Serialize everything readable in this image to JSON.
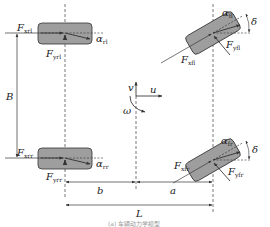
{
  "diagram": {
    "type": "vehicle-dynamics-four-wheel-model",
    "colors": {
      "wheel_fill": "#9e9e9e",
      "wheel_stroke": "#333333",
      "line": "#333333",
      "background": "#ffffff"
    },
    "coordinate_system": {
      "v_label": "v",
      "u_label": "u",
      "omega_label": "ω"
    },
    "dimensions": {
      "track_width_label": "B",
      "rear_to_cg_label": "b",
      "front_to_cg_label": "a",
      "wheelbase_label": "L"
    },
    "wheels": {
      "rear_left": {
        "fx_main": "F",
        "fx_sub": "xrl",
        "fy_main": "F",
        "fy_sub": "yrl",
        "alpha_main": "α",
        "alpha_sub": "rl"
      },
      "rear_right": {
        "fx_main": "F",
        "fx_sub": "xrr",
        "fy_main": "F",
        "fy_sub": "yrr",
        "alpha_main": "α",
        "alpha_sub": "rr"
      },
      "front_left": {
        "fx_main": "F",
        "fx_sub": "xfl",
        "fy_main": "F",
        "fy_sub": "yfl",
        "alpha_main": "α",
        "alpha_sub": "fl",
        "steer_label": "δ"
      },
      "front_right": {
        "fx_main": "F",
        "fx_sub": "xfr",
        "fy_main": "F",
        "fy_sub": "yfr",
        "alpha_main": "α",
        "alpha_sub": "fr",
        "steer_label": "δ"
      }
    },
    "caption": "(a) 车辆动力学模型"
  }
}
